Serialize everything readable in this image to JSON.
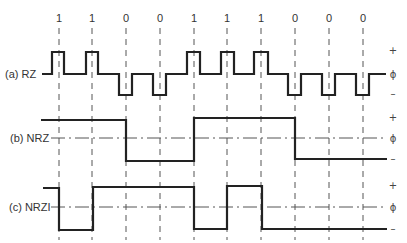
{
  "diagram": {
    "bits": [
      "1",
      "1",
      "0",
      "0",
      "1",
      "1",
      "1",
      "0",
      "0",
      "0"
    ],
    "rows": [
      {
        "id": "rz",
        "label": "(a) RZ",
        "levels": {
          "plus": "+",
          "zero": "ϕ",
          "minus": "–"
        }
      },
      {
        "id": "nrz",
        "label": "(b) NRZ",
        "levels": {
          "plus": "+",
          "zero": "ϕ",
          "minus": "–"
        }
      },
      {
        "id": "nrzi",
        "label": "(c) NRZI",
        "levels": {
          "plus": "+",
          "zero": "ϕ",
          "minus": "–"
        }
      }
    ]
  }
}
